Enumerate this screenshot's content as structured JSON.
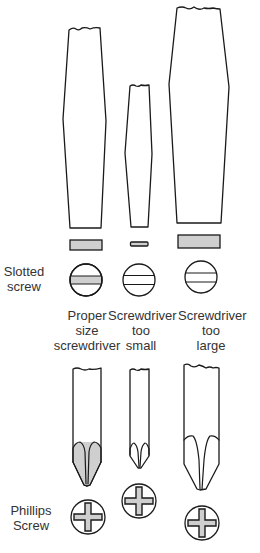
{
  "diagram": {
    "colors": {
      "outline": "#1a1a1a",
      "fill_contact": "#cfcfcf",
      "background": "#ffffff",
      "label_text": "#333333"
    },
    "slotted_section": {
      "row_label": [
        "Slotted",
        "screw"
      ],
      "columns": [
        {
          "id": "proper",
          "caption": [
            "Proper",
            "size",
            "screwdriver"
          ]
        },
        {
          "id": "too-small",
          "caption": [
            "Screwdriver",
            "too",
            "small"
          ]
        },
        {
          "id": "too-large",
          "caption": [
            "Screwdriver",
            "too",
            "large"
          ]
        }
      ]
    },
    "phillips_section": {
      "row_label": [
        "Phillips",
        "Screw"
      ]
    }
  }
}
